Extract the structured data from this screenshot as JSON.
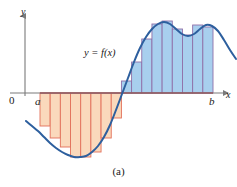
{
  "figure": {
    "caption": "(a)",
    "curve_label": "y = f(x)",
    "axis_labels": {
      "x": "x",
      "y": "y",
      "origin": "0",
      "lower_limit": "a",
      "upper_limit": "b"
    },
    "colors": {
      "curve": "#2d5f9e",
      "axis": "#7a7a7a",
      "positive_fill": "#a8cfee",
      "positive_stroke": "#8f6fa8",
      "negative_fill": "#fad9bc",
      "negative_stroke": "#e2705a",
      "baseline": "#b03a4a",
      "text": "#1a1a1a"
    }
  },
  "chart_data": {
    "type": "area",
    "title": "",
    "subtitle": "",
    "xlabel": "x",
    "ylabel": "y",
    "caption": "(a)",
    "series_label": "y = f(x)",
    "grid": false,
    "legend_position": "none",
    "xlim": [
      0,
      237
    ],
    "ylim": [
      -82,
      82
    ],
    "axis_origin_px": {
      "x": 25,
      "y": 93
    },
    "x_axis_y_px": 93,
    "interval": {
      "a": 40,
      "b": 213
    },
    "curve_points_px": [
      [
        26,
        121
      ],
      [
        32,
        126
      ],
      [
        38,
        131
      ],
      [
        44,
        137
      ],
      [
        50,
        143
      ],
      [
        56,
        148
      ],
      [
        62,
        152
      ],
      [
        68,
        155
      ],
      [
        74,
        157
      ],
      [
        80,
        157
      ],
      [
        86,
        156
      ],
      [
        92,
        152
      ],
      [
        98,
        146
      ],
      [
        104,
        137
      ],
      [
        110,
        125
      ],
      [
        116,
        110
      ],
      [
        122,
        94
      ],
      [
        128,
        78
      ],
      [
        134,
        62
      ],
      [
        140,
        48
      ],
      [
        146,
        37
      ],
      [
        152,
        29
      ],
      [
        158,
        24
      ],
      [
        164,
        22
      ],
      [
        170,
        24
      ],
      [
        176,
        29
      ],
      [
        182,
        34
      ],
      [
        188,
        36
      ],
      [
        194,
        34
      ],
      [
        200,
        29
      ],
      [
        206,
        25
      ],
      [
        212,
        26
      ],
      [
        218,
        31
      ],
      [
        224,
        40
      ],
      [
        230,
        50
      ],
      [
        236,
        59
      ]
    ],
    "negative_rectangles": [
      {
        "x": 40,
        "width": 13,
        "top_px": 93,
        "height": 33,
        "value": -33
      },
      {
        "x": 53,
        "width": 13,
        "top_px": 93,
        "height": 45,
        "value": -45
      },
      {
        "x": 66,
        "width": 13,
        "top_px": 93,
        "height": 54,
        "value": -54
      },
      {
        "x": 79,
        "width": 13,
        "top_px": 93,
        "height": 64,
        "value": -64
      },
      {
        "x": 92,
        "width": 13,
        "top_px": 93,
        "height": 64,
        "value": -64
      },
      {
        "x": 105,
        "width": 13,
        "top_px": 93,
        "height": 59,
        "value": -59
      },
      {
        "x": 118,
        "width": 13,
        "top_px": 93,
        "height": 45,
        "value": -45
      },
      {
        "x": 131,
        "width": 13,
        "top_px": 93,
        "height": 25,
        "value": -25
      }
    ],
    "positive_rectangles": [
      {
        "x": 144,
        "width": 13,
        "bottom_px": 93,
        "height": 12,
        "value": 12
      },
      {
        "x": 157,
        "width": 13,
        "bottom_px": 93,
        "height": 31,
        "value": 31
      },
      {
        "x": 170,
        "width": 13,
        "bottom_px": 93,
        "height": 54,
        "value": 54
      },
      {
        "x": 183,
        "width": 13,
        "bottom_px": 93,
        "height": 69,
        "value": 69
      },
      {
        "x": 196,
        "width": 13,
        "bottom_px": 93,
        "height": 72,
        "value": 72
      },
      {
        "x": 209,
        "width": 13,
        "bottom_px": 93,
        "height": 64,
        "value": 64
      },
      {
        "x": 222,
        "width": 13,
        "bottom_px": 93,
        "height": 58,
        "value": 58
      },
      {
        "x": 235,
        "width": 13,
        "bottom_px": 93,
        "height": 68,
        "value": 68
      },
      {
        "x": 248,
        "width": 13,
        "bottom_px": 93,
        "height": 66,
        "value": 66
      }
    ]
  }
}
